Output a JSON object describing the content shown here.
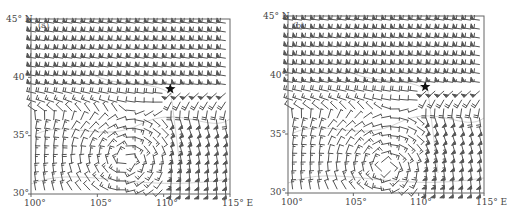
{
  "figure": {
    "panels": [
      {
        "id": "a",
        "label": "(a)",
        "frame": {
          "left": 31,
          "top": 19,
          "right": 230,
          "bottom": 194
        },
        "y_ticks": [
          {
            "label": "45° N",
            "lat": 45
          },
          {
            "label": "40°",
            "lat": 40
          },
          {
            "label": "35°",
            "lat": 35
          },
          {
            "label": "30°",
            "lat": 30
          }
        ],
        "x_ticks": [
          {
            "label": "100°",
            "lon": 100
          },
          {
            "label": "105°",
            "lon": 105
          },
          {
            "label": "110°",
            "lon": 110
          },
          {
            "label": "115° E",
            "lon": 115
          }
        ],
        "marker": {
          "symbol": "star",
          "lon": 110.5,
          "lat": 39.0,
          "color": "#111111"
        },
        "field": {
          "vortex_center": [
            107.2,
            33.0
          ],
          "westerly_north": true,
          "southerly_east": true
        }
      },
      {
        "id": "b",
        "label": "(b)",
        "frame": {
          "left": 288,
          "top": 16,
          "right": 484,
          "bottom": 193
        },
        "y_ticks": [
          {
            "label": "45° N",
            "lat": 45
          },
          {
            "label": "40°",
            "lat": 40
          },
          {
            "label": "35°",
            "lat": 35
          },
          {
            "label": "30°",
            "lat": 30
          }
        ],
        "x_ticks": [
          {
            "label": "100°",
            "lon": 100
          },
          {
            "label": "105°",
            "lon": 105
          },
          {
            "label": "110°",
            "lon": 110
          },
          {
            "label": "115° E",
            "lon": 115
          }
        ],
        "marker": {
          "symbol": "star",
          "lon": 110.5,
          "lat": 39.0,
          "color": "#111111"
        },
        "field": {
          "vortex_center": [
            107.5,
            32.2
          ],
          "westerly_north": true,
          "southerly_east": true
        }
      }
    ],
    "extent": {
      "lon": [
        100,
        115
      ],
      "lat": [
        30,
        45
      ]
    },
    "styles": {
      "barb_color": "#555555",
      "frame_color": "#666666",
      "boundary_color": "#c8c8c8",
      "text_color": "#444444"
    }
  }
}
